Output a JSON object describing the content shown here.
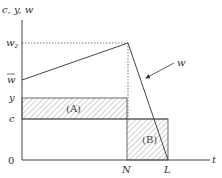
{
  "diagram": {
    "y_axis_label": "c, y, w",
    "x_axis_label": "t",
    "origin_label": "0",
    "y_ticks": {
      "w_z": "w",
      "w_z_sub": "z",
      "w_bar": "w",
      "y": "y",
      "c": "c"
    },
    "x_ticks": {
      "N": "N",
      "L": "L"
    },
    "curve_label": "w",
    "regions": {
      "A": "(A)",
      "B": "(B)"
    },
    "colors": {
      "line": "#444444",
      "hatch": "#777777",
      "background": "#ffffff"
    }
  }
}
